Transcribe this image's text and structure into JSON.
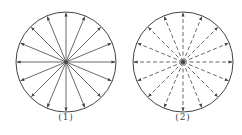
{
  "figures": [
    {
      "label": "(1)",
      "style": "solid",
      "cx": 66,
      "cy": 62,
      "r": 50,
      "rays": 16,
      "arrow_direction": "outward"
    },
    {
      "label": "(2)",
      "style": "dashed",
      "cx": 183,
      "cy": 62,
      "r": 50,
      "rays": 16,
      "arrow_direction": "outward"
    }
  ],
  "colors": {
    "stroke": "#444444",
    "background": "#ffffff"
  }
}
